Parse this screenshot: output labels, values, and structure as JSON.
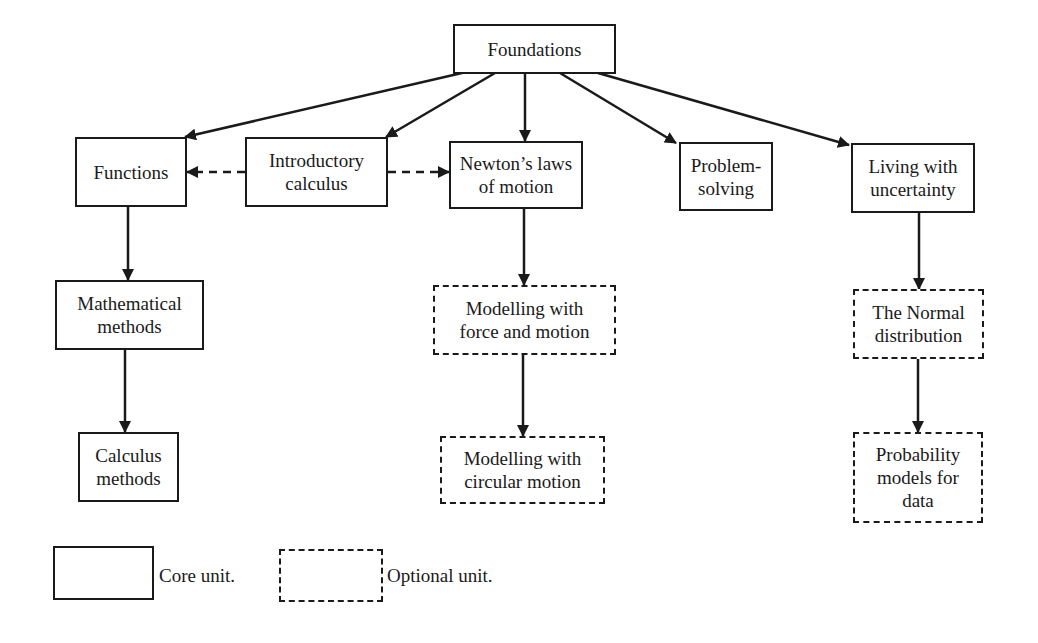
{
  "diagram": {
    "type": "flowchart",
    "nodes": [
      {
        "id": "foundations",
        "label": "Foundations",
        "kind": "core",
        "x": 453,
        "y": 24,
        "w": 163,
        "h": 50
      },
      {
        "id": "functions",
        "label": "Functions",
        "kind": "core",
        "x": 75,
        "y": 137,
        "w": 112,
        "h": 70
      },
      {
        "id": "intro-calculus",
        "label": "Introductory\ncalculus",
        "kind": "core",
        "x": 245,
        "y": 137,
        "w": 143,
        "h": 70
      },
      {
        "id": "newtons-laws",
        "label": "Newton’s laws\nof motion",
        "kind": "core",
        "x": 449,
        "y": 141,
        "w": 134,
        "h": 68
      },
      {
        "id": "problem-solving",
        "label": "Problem-\nsolving",
        "kind": "core",
        "x": 679,
        "y": 142,
        "w": 94,
        "h": 69
      },
      {
        "id": "living-uncertainty",
        "label": "Living with\nuncertainty",
        "kind": "core",
        "x": 851,
        "y": 143,
        "w": 124,
        "h": 70
      },
      {
        "id": "math-methods",
        "label": "Mathematical\nmethods",
        "kind": "core",
        "x": 55,
        "y": 280,
        "w": 149,
        "h": 70
      },
      {
        "id": "calculus-methods",
        "label": "Calculus\nmethods",
        "kind": "core",
        "x": 78,
        "y": 432,
        "w": 101,
        "h": 70
      },
      {
        "id": "force-motion",
        "label": "Modelling with\nforce and motion",
        "kind": "optional",
        "x": 433,
        "y": 285,
        "w": 183,
        "h": 70
      },
      {
        "id": "circular-motion",
        "label": "Modelling with\ncircular motion",
        "kind": "optional",
        "x": 440,
        "y": 436,
        "w": 165,
        "h": 68
      },
      {
        "id": "normal-distribution",
        "label": "The Normal\ndistribution",
        "kind": "optional",
        "x": 853,
        "y": 289,
        "w": 131,
        "h": 70
      },
      {
        "id": "probability-models",
        "label": "Probability\nmodels for\ndata",
        "kind": "optional",
        "x": 853,
        "y": 432,
        "w": 130,
        "h": 91
      }
    ],
    "edges": [
      {
        "from": "foundations",
        "to": "functions",
        "style": "solid",
        "x1": 462,
        "y1": 73,
        "x2": 185,
        "y2": 137
      },
      {
        "from": "foundations",
        "to": "intro-calculus",
        "style": "solid",
        "x1": 495,
        "y1": 73,
        "x2": 386,
        "y2": 137
      },
      {
        "from": "foundations",
        "to": "newtons-laws",
        "style": "solid",
        "x1": 525,
        "y1": 73,
        "x2": 525,
        "y2": 141
      },
      {
        "from": "foundations",
        "to": "problem-solving",
        "style": "solid",
        "x1": 560,
        "y1": 73,
        "x2": 676,
        "y2": 143
      },
      {
        "from": "foundations",
        "to": "living-uncertainty",
        "style": "solid",
        "x1": 598,
        "y1": 73,
        "x2": 849,
        "y2": 145
      },
      {
        "from": "intro-calculus",
        "to": "functions",
        "style": "dashed",
        "x1": 245,
        "y1": 172,
        "x2": 187,
        "y2": 172
      },
      {
        "from": "intro-calculus",
        "to": "newtons-laws",
        "style": "dashed",
        "x1": 388,
        "y1": 172,
        "x2": 449,
        "y2": 172
      },
      {
        "from": "functions",
        "to": "math-methods",
        "style": "solid",
        "x1": 128,
        "y1": 207,
        "x2": 128,
        "y2": 280
      },
      {
        "from": "math-methods",
        "to": "calculus-methods",
        "style": "solid",
        "x1": 125,
        "y1": 350,
        "x2": 125,
        "y2": 432
      },
      {
        "from": "newtons-laws",
        "to": "force-motion",
        "style": "solid",
        "x1": 524,
        "y1": 209,
        "x2": 524,
        "y2": 285
      },
      {
        "from": "force-motion",
        "to": "circular-motion",
        "style": "solid",
        "x1": 523,
        "y1": 355,
        "x2": 523,
        "y2": 436
      },
      {
        "from": "living-uncertainty",
        "to": "normal-distribution",
        "style": "solid",
        "x1": 919,
        "y1": 213,
        "x2": 919,
        "y2": 289
      },
      {
        "from": "normal-distribution",
        "to": "probability-models",
        "style": "solid",
        "x1": 918,
        "y1": 359,
        "x2": 918,
        "y2": 432
      }
    ]
  },
  "legend": {
    "items": [
      {
        "kind": "core",
        "label": "Core unit.",
        "box": {
          "x": 53,
          "y": 546,
          "w": 101,
          "h": 54
        },
        "label_pos": {
          "x": 159,
          "y": 564
        }
      },
      {
        "kind": "optional",
        "label": "Optional unit.",
        "box": {
          "x": 279,
          "y": 549,
          "w": 104,
          "h": 53
        },
        "label_pos": {
          "x": 387,
          "y": 564
        }
      }
    ]
  },
  "colors": {
    "ink": "#1a1a1a",
    "background": "#ffffff"
  }
}
